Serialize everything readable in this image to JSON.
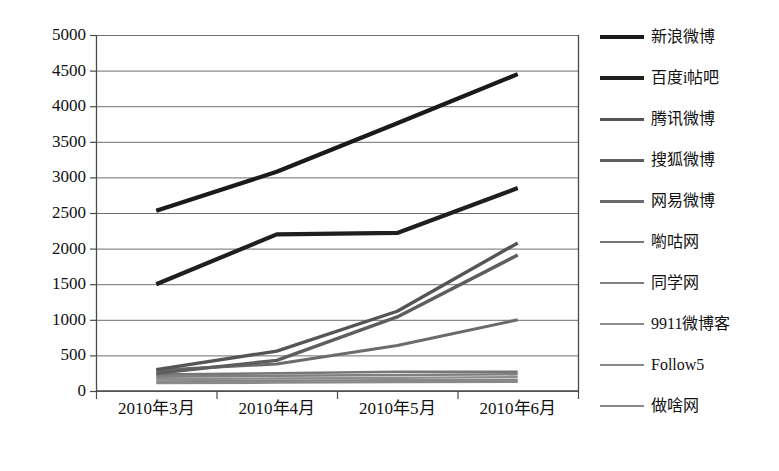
{
  "chart_data": {
    "type": "line",
    "title": "",
    "subtitle": "",
    "xlabel": "",
    "ylabel": "",
    "categories": [
      "2010年3月",
      "2010年4月",
      "2010年5月",
      "2010年6月"
    ],
    "ylim": [
      0,
      5000
    ],
    "yticks": [
      0,
      500,
      1000,
      1500,
      2000,
      2500,
      3000,
      3500,
      4000,
      4500,
      5000
    ],
    "grid": true,
    "legend_position": "right",
    "series": [
      {
        "name": "新浪微博",
        "values": [
          2530,
          3080,
          3760,
          4450
        ],
        "color": "#1a1a1a",
        "width": 4.2
      },
      {
        "name": "百度i帖吧",
        "values": [
          1500,
          2200,
          2220,
          2850
        ],
        "color": "#1f1f1f",
        "width": 4.2
      },
      {
        "name": "腾讯微博",
        "values": [
          300,
          560,
          1120,
          2080
        ],
        "color": "#555555",
        "width": 3.4
      },
      {
        "name": "搜狐微博",
        "values": [
          250,
          430,
          1040,
          1910
        ],
        "color": "#5e5e5e",
        "width": 3.4
      },
      {
        "name": "网易微博",
        "values": [
          290,
          380,
          640,
          1000
        ],
        "color": "#6b6b6b",
        "width": 3.0
      },
      {
        "name": "喲咕网",
        "values": [
          230,
          250,
          270,
          270
        ],
        "color": "#777777",
        "width": 2.6
      },
      {
        "name": "同学网",
        "values": [
          200,
          215,
          225,
          235
        ],
        "color": "#808080",
        "width": 2.6
      },
      {
        "name": "9911微博客",
        "values": [
          165,
          175,
          185,
          195
        ],
        "color": "#8d8d8d",
        "width": 2.4
      },
      {
        "name": "Follow5",
        "values": [
          135,
          145,
          150,
          155
        ],
        "color": "#888888",
        "width": 2.4
      },
      {
        "name": "做啥网",
        "values": [
          110,
          118,
          125,
          130
        ],
        "color": "#8a8a8a",
        "width": 2.4
      }
    ]
  },
  "axes": {
    "y_tick_labels": [
      "5000",
      "4500",
      "4000",
      "3500",
      "3000",
      "2500",
      "2000",
      "1500",
      "1000",
      "500",
      "0"
    ],
    "x_tick_labels": [
      "2010年3月",
      "2010年4月",
      "2010年5月",
      "2010年6月"
    ]
  },
  "legend": {
    "items": [
      {
        "label": "新浪微博"
      },
      {
        "label": "百度i帖吧"
      },
      {
        "label": "腾讯微博"
      },
      {
        "label": "搜狐微博"
      },
      {
        "label": "网易微博"
      },
      {
        "label": "喲咕网"
      },
      {
        "label": "同学网"
      },
      {
        "label": "9911微博客"
      },
      {
        "label": "Follow5"
      },
      {
        "label": "做啥网"
      }
    ]
  }
}
